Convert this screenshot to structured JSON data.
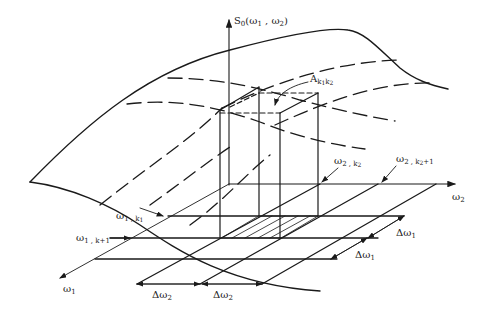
{
  "diagram": {
    "axes": {
      "vertical": {
        "main": "S",
        "sub": "0",
        "args": "(ω",
        "a1": "1",
        "comma": " , ω",
        "a2": "2",
        "close": ")"
      },
      "w1": {
        "main": "ω",
        "sub": "1"
      },
      "w2": {
        "main": "ω",
        "sub": "2"
      }
    },
    "labels": {
      "amplitude": {
        "main": "A",
        "sub1": "k",
        "sub1s": "1",
        "sub2": "k",
        "sub2s": "2"
      },
      "w1_k1": {
        "main": "ω",
        "sub": "1 , k",
        "subs": "1"
      },
      "w1_k1p1": {
        "main": "ω",
        "sub": "1 , k+1"
      },
      "w2_k2": {
        "main": "ω",
        "sub": "2 , k",
        "subs": "2"
      },
      "w2_k2p1": {
        "main": "ω",
        "sub": "2 , k",
        "subs": "2",
        "tail": "+1"
      },
      "dw1_a": {
        "main": "Δω",
        "sub": "1"
      },
      "dw1_b": {
        "main": "Δω",
        "sub": "1"
      },
      "dw2_a": {
        "main": "Δω",
        "sub": "2"
      },
      "dw2_b": {
        "main": "Δω",
        "sub": "2"
      }
    },
    "colors": {
      "ink": "#1a1a1a",
      "background": "#ffffff"
    }
  }
}
